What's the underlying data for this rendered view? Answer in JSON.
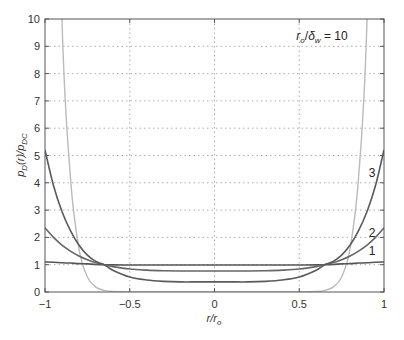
{
  "chart_data": {
    "type": "line",
    "title": "",
    "annotation": "r_o/δ_w = 10",
    "xlabel": "r/r_o",
    "ylabel": "p_D(r)/p_DC",
    "xlim": [
      -1,
      1
    ],
    "ylim": [
      0,
      10
    ],
    "xticks": [
      -1,
      -0.5,
      0,
      0.5,
      1
    ],
    "xtick_labels": [
      "−1",
      "−0.5",
      "0",
      "0.5",
      "1"
    ],
    "yticks": [
      0,
      1,
      2,
      3,
      4,
      5,
      6,
      7,
      8,
      9,
      10
    ],
    "ytick_labels": [
      "0",
      "1",
      "2",
      "3",
      "4",
      "5",
      "6",
      "7",
      "8",
      "9",
      "10"
    ],
    "grid": true,
    "grid_style": "dotted",
    "legend": "none (curves labeled inline 1, 2, 3)",
    "x": [
      -1,
      -0.95,
      -0.9,
      -0.85,
      -0.8,
      -0.75,
      -0.7,
      -0.65,
      -0.6,
      -0.5,
      -0.4,
      -0.3,
      -0.2,
      -0.1,
      0,
      0.1,
      0.2,
      0.3,
      0.4,
      0.5,
      0.6,
      0.65,
      0.7,
      0.75,
      0.8,
      0.85,
      0.9,
      0.95,
      1
    ],
    "series": [
      {
        "name": "1",
        "color": "#555555",
        "values": [
          1.1,
          1.09,
          1.07,
          1.06,
          1.04,
          1.03,
          1.01,
          1.0,
          0.995,
          0.99,
          0.99,
          0.99,
          0.99,
          0.99,
          0.99,
          0.99,
          0.99,
          0.99,
          0.99,
          0.99,
          0.995,
          1.0,
          1.01,
          1.03,
          1.04,
          1.06,
          1.07,
          1.09,
          1.1
        ]
      },
      {
        "name": "2",
        "color": "#666666",
        "values": [
          2.35,
          2.0,
          1.72,
          1.5,
          1.32,
          1.18,
          1.07,
          1.0,
          0.93,
          0.84,
          0.8,
          0.78,
          0.77,
          0.77,
          0.77,
          0.77,
          0.77,
          0.78,
          0.8,
          0.84,
          0.93,
          1.0,
          1.07,
          1.18,
          1.32,
          1.5,
          1.72,
          2.0,
          2.35
        ]
      },
      {
        "name": "3",
        "color": "#5a5a5a",
        "values": [
          5.2,
          3.9,
          2.95,
          2.25,
          1.72,
          1.35,
          1.12,
          1.0,
          0.8,
          0.55,
          0.44,
          0.39,
          0.37,
          0.37,
          0.37,
          0.37,
          0.37,
          0.39,
          0.44,
          0.55,
          0.8,
          1.0,
          1.12,
          1.35,
          1.72,
          2.25,
          2.95,
          3.9,
          5.2
        ]
      },
      {
        "name": "4 (unlabeled, light gray)",
        "color": "#bbbbbb",
        "values": [
          60,
          25,
          10,
          4.2,
          1.6,
          0.55,
          0.18,
          0.06,
          0.02,
          0.005,
          0.001,
          0,
          0,
          0,
          0,
          0,
          0,
          0,
          0.001,
          0.005,
          0.02,
          0.06,
          0.18,
          0.55,
          1.6,
          4.2,
          10,
          25,
          60
        ]
      }
    ],
    "inline_labels": [
      {
        "text": "3",
        "x": 0.93,
        "y": 4.2
      },
      {
        "text": "2",
        "x": 0.93,
        "y": 2.0
      },
      {
        "text": "1",
        "x": 0.93,
        "y": 1.35
      }
    ]
  }
}
